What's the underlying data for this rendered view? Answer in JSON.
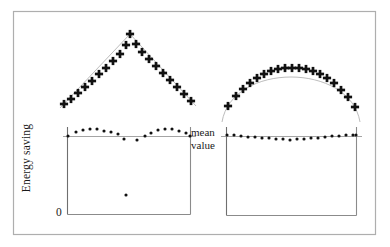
{
  "figure": {
    "name": "energy-saving-two-panel-figure",
    "outer_frame": {
      "x": 13,
      "y": 11,
      "w": 363,
      "h": 224,
      "stroke": "#aeaeae"
    },
    "labels": {
      "y_axis": "Energy saving",
      "y_zero": "0",
      "mean_line_top": "mean",
      "mean_line_bottom": "value"
    },
    "colors": {
      "marker": "#111111",
      "axis": "#6f6f6f",
      "curve": "#a8a8a8",
      "frame": "#aeaeae",
      "mean_line": "#9a9a9a"
    }
  },
  "chart_data": [
    {
      "type": "scatter",
      "name": "top-left-triangular-peak",
      "title": "",
      "xlabel": "",
      "ylabel": "",
      "marker": "plus",
      "xlim": [
        60,
        196
      ],
      "ylim": [
        18,
        112
      ],
      "grid": false,
      "legend": "none",
      "guide_curve": "triangular peak (rising then falling straight segments)",
      "points": [
        {
          "x": 64,
          "y": 104
        },
        {
          "x": 71,
          "y": 99
        },
        {
          "x": 78,
          "y": 93
        },
        {
          "x": 85,
          "y": 87
        },
        {
          "x": 92,
          "y": 81
        },
        {
          "x": 99,
          "y": 74
        },
        {
          "x": 106,
          "y": 68
        },
        {
          "x": 113,
          "y": 61
        },
        {
          "x": 120,
          "y": 54
        },
        {
          "x": 126,
          "y": 45
        },
        {
          "x": 130,
          "y": 34
        },
        {
          "x": 136,
          "y": 44
        },
        {
          "x": 142,
          "y": 52
        },
        {
          "x": 149,
          "y": 59
        },
        {
          "x": 156,
          "y": 66
        },
        {
          "x": 163,
          "y": 73
        },
        {
          "x": 170,
          "y": 80
        },
        {
          "x": 177,
          "y": 87
        },
        {
          "x": 184,
          "y": 94
        },
        {
          "x": 191,
          "y": 101
        }
      ]
    },
    {
      "type": "scatter",
      "name": "top-right-dome",
      "title": "",
      "xlabel": "",
      "ylabel": "",
      "marker": "plus",
      "xlim": [
        222,
        360
      ],
      "ylim": [
        40,
        122
      ],
      "grid": false,
      "legend": "none",
      "guide_curve": "semicircular dome / arch",
      "points": [
        {
          "x": 228,
          "y": 106
        },
        {
          "x": 236,
          "y": 96
        },
        {
          "x": 243,
          "y": 89
        },
        {
          "x": 250,
          "y": 83
        },
        {
          "x": 257,
          "y": 78
        },
        {
          "x": 264,
          "y": 74
        },
        {
          "x": 271,
          "y": 71
        },
        {
          "x": 278,
          "y": 69
        },
        {
          "x": 285,
          "y": 68
        },
        {
          "x": 292,
          "y": 68
        },
        {
          "x": 299,
          "y": 68
        },
        {
          "x": 306,
          "y": 69
        },
        {
          "x": 313,
          "y": 71
        },
        {
          "x": 320,
          "y": 74
        },
        {
          "x": 327,
          "y": 78
        },
        {
          "x": 334,
          "y": 83
        },
        {
          "x": 341,
          "y": 90
        },
        {
          "x": 348,
          "y": 97
        },
        {
          "x": 355,
          "y": 107
        }
      ]
    },
    {
      "type": "scatter",
      "name": "bottom-left-residuals",
      "title": "",
      "xlabel": "",
      "ylabel": "Energy saving",
      "marker": "dot",
      "xlim": [
        67,
        190
      ],
      "ylim": [
        0,
        1
      ],
      "y_zero_pixel": 214,
      "mean_line_pixel": 136,
      "grid": false,
      "legend": "none",
      "points": [
        {
          "x": 68,
          "y": 136
        },
        {
          "x": 76,
          "y": 132
        },
        {
          "x": 83,
          "y": 130
        },
        {
          "x": 90,
          "y": 129
        },
        {
          "x": 97,
          "y": 129
        },
        {
          "x": 104,
          "y": 131
        },
        {
          "x": 111,
          "y": 132
        },
        {
          "x": 118,
          "y": 134
        },
        {
          "x": 124,
          "y": 139
        },
        {
          "x": 126,
          "y": 195
        },
        {
          "x": 137,
          "y": 140
        },
        {
          "x": 145,
          "y": 136
        },
        {
          "x": 151,
          "y": 133
        },
        {
          "x": 158,
          "y": 130
        },
        {
          "x": 165,
          "y": 129
        },
        {
          "x": 172,
          "y": 129
        },
        {
          "x": 179,
          "y": 131
        },
        {
          "x": 186,
          "y": 133
        },
        {
          "x": 190,
          "y": 136
        }
      ],
      "outlier": {
        "x": 126,
        "y": 195,
        "note": "single low point well below mean line"
      }
    },
    {
      "type": "scatter",
      "name": "bottom-right-residuals",
      "title": "",
      "xlabel": "",
      "ylabel": "",
      "marker": "dot",
      "xlim": [
        226,
        356
      ],
      "ylim": [
        0,
        1
      ],
      "y_zero_pixel": 215,
      "mean_line_pixel": 136,
      "grid": false,
      "legend": "none",
      "points": [
        {
          "x": 227,
          "y": 135
        },
        {
          "x": 234,
          "y": 135
        },
        {
          "x": 241,
          "y": 136
        },
        {
          "x": 248,
          "y": 137
        },
        {
          "x": 255,
          "y": 137
        },
        {
          "x": 262,
          "y": 138
        },
        {
          "x": 269,
          "y": 138
        },
        {
          "x": 276,
          "y": 139
        },
        {
          "x": 283,
          "y": 139
        },
        {
          "x": 290,
          "y": 140
        },
        {
          "x": 297,
          "y": 139
        },
        {
          "x": 304,
          "y": 139
        },
        {
          "x": 311,
          "y": 138
        },
        {
          "x": 318,
          "y": 138
        },
        {
          "x": 325,
          "y": 137
        },
        {
          "x": 332,
          "y": 136
        },
        {
          "x": 339,
          "y": 136
        },
        {
          "x": 346,
          "y": 135
        },
        {
          "x": 353,
          "y": 135
        },
        {
          "x": 356,
          "y": 135
        }
      ]
    }
  ]
}
